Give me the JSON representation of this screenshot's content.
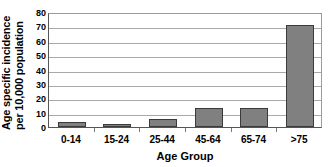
{
  "chart_data": {
    "type": "bar",
    "title": "",
    "categories": [
      "0-14",
      "15-24",
      "25-44",
      "45-64",
      "65-74",
      ">75"
    ],
    "values": [
      3.5,
      2,
      5.5,
      13,
      13,
      71
    ],
    "xlabel": "Age Group",
    "ylabel_line1": "Age specific incidence",
    "ylabel_line2": "per 10,000 population",
    "ylim": [
      0,
      80
    ],
    "ytick_values": [
      80,
      70,
      60,
      50,
      40,
      30,
      20,
      10,
      0
    ],
    "ytick_labels": [
      "80",
      "70",
      "60",
      "50",
      "40",
      "30",
      "20",
      "10",
      "0"
    ],
    "grid": true,
    "legend": "none",
    "bar_color": "#808080",
    "bar_border_color": "#3b3b3b",
    "gridline_color": "#a9a9a9",
    "axis_color": "#555555"
  }
}
